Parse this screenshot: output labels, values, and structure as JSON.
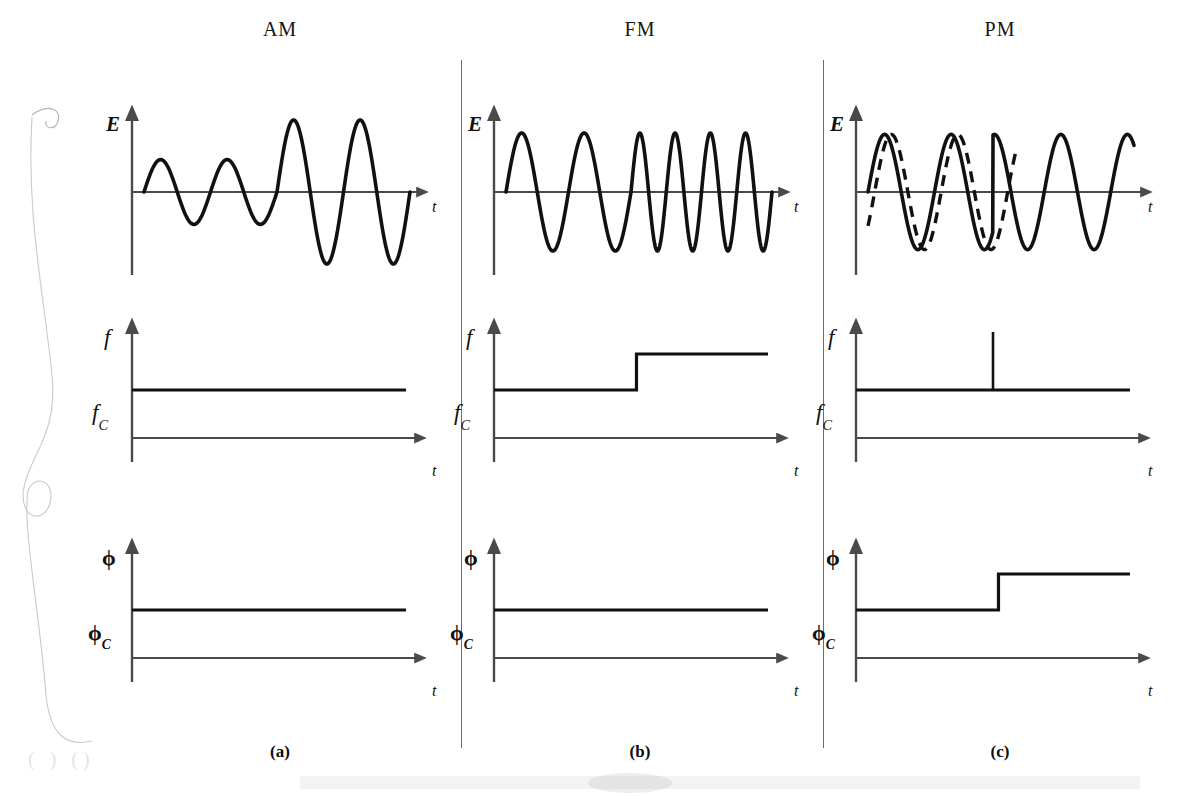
{
  "figure": {
    "background": "#ffffff",
    "stroke_color": "#111111",
    "axis_color": "#4a4a4a",
    "divider_color": "#6d6d6d",
    "width": 1177,
    "height": 796
  },
  "columns": [
    {
      "header": "AM",
      "footer": "(a)",
      "key": "am"
    },
    {
      "header": "FM",
      "footer": "(b)",
      "key": "fm"
    },
    {
      "header": "PM",
      "footer": "(c)",
      "key": "pm"
    }
  ],
  "rows": [
    {
      "key": "E",
      "y_label": "E",
      "y_tick": "",
      "x_label": "t"
    },
    {
      "key": "f",
      "y_label": "f",
      "y_tick": "f",
      "y_tick_sub": "C",
      "x_label": "t"
    },
    {
      "key": "phi",
      "y_label": "ϕ",
      "y_tick": "ϕ",
      "y_tick_sub": "C",
      "x_label": "t"
    }
  ],
  "chart_data": [
    {
      "id": "am-E",
      "type": "line",
      "title": "AM carrier amplitude vs time",
      "xlabel": "t",
      "ylabel": "E",
      "description": "Sinusoidal carrier at constant frequency whose amplitude steps from low to high halfway through",
      "carrier_cycles": 4,
      "amplitude_envelope": [
        0.45,
        0.45,
        1.0,
        1.0
      ],
      "ylim": [
        -1.15,
        1.15
      ]
    },
    {
      "id": "am-f",
      "type": "line",
      "title": "AM instantaneous frequency vs time",
      "xlabel": "t",
      "ylabel": "f",
      "tick_label": "fC",
      "description": "Constant frequency at fC for the entire record",
      "x": [
        0,
        1
      ],
      "values": [
        1,
        1
      ],
      "level_fc": 1
    },
    {
      "id": "am-phi",
      "type": "line",
      "title": "AM instantaneous phase vs time",
      "xlabel": "t",
      "ylabel": "ϕ",
      "tick_label": "ϕC",
      "description": "Constant phase at ϕC for the entire record",
      "x": [
        0,
        1
      ],
      "values": [
        1,
        1
      ],
      "level_fc": 1
    },
    {
      "id": "fm-E",
      "type": "line",
      "title": "FM carrier amplitude vs time",
      "xlabel": "t",
      "ylabel": "E",
      "description": "Constant amplitude sinusoid whose frequency doubles halfway through",
      "cycles_before_step": 2,
      "cycles_after_step": 4,
      "amplitude": 1.0,
      "ylim": [
        -1.15,
        1.15
      ]
    },
    {
      "id": "fm-f",
      "type": "line",
      "title": "FM instantaneous frequency vs time",
      "xlabel": "t",
      "ylabel": "f",
      "tick_label": "fC",
      "description": "Step increase in frequency above fC at mid record",
      "x": [
        0,
        0.52,
        0.52,
        1
      ],
      "values": [
        1,
        1,
        2,
        2
      ],
      "step_position": 0.52,
      "level_fc": 1,
      "level_high": 2
    },
    {
      "id": "fm-phi",
      "type": "line",
      "title": "FM instantaneous phase vs time",
      "xlabel": "t",
      "ylabel": "ϕ",
      "tick_label": "ϕC",
      "description": "Constant phase at ϕC for the entire record",
      "x": [
        0,
        1
      ],
      "values": [
        1,
        1
      ],
      "level_fc": 1
    },
    {
      "id": "pm-E",
      "type": "line",
      "title": "PM carrier amplitude vs time",
      "xlabel": "t",
      "ylabel": "E",
      "description": "Solid modulated carrier advanced in phase relative to the dashed unmodulated reference carrier; phase advance occurs at mid record",
      "cycles": 4,
      "amplitude": 1.0,
      "phase_shift_position": 0.47,
      "phase_shift_amount": 0.35,
      "reference_series": "dashed unmodulated carrier",
      "ylim": [
        -1.15,
        1.15
      ]
    },
    {
      "id": "pm-f",
      "type": "line",
      "title": "PM instantaneous frequency vs time",
      "xlabel": "t",
      "ylabel": "f",
      "tick_label": "fC",
      "description": "Constant frequency at fC with a single narrow impulse spike at mid record",
      "x": [
        0,
        0.5,
        0.5,
        0.5,
        1
      ],
      "values": [
        1,
        1,
        4.2,
        1,
        1
      ],
      "impulse_position": 0.5,
      "impulse_height": 4.2,
      "level_fc": 1
    },
    {
      "id": "pm-phi",
      "type": "line",
      "title": "PM instantaneous phase vs time",
      "xlabel": "t",
      "ylabel": "ϕ",
      "tick_label": "ϕC",
      "description": "Step increase in phase above ϕC at mid record",
      "x": [
        0,
        0.52,
        0.52,
        1
      ],
      "values": [
        1,
        1,
        2,
        2
      ],
      "step_position": 0.52,
      "level_fc": 1,
      "level_high": 2
    }
  ]
}
